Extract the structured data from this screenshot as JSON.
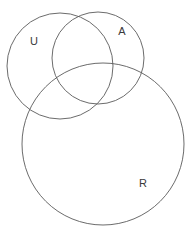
{
  "diagram": {
    "type": "venn",
    "title": "",
    "background_color": "#ffffff",
    "stroke_color": "#5a5a5a",
    "label_color": "#3a3a3a",
    "sets": [
      {
        "id": "U",
        "label": "U",
        "label_x": 34,
        "label_y": 42,
        "cx": 60,
        "cy": 66,
        "r": 53
      },
      {
        "id": "A",
        "label": "A",
        "label_x": 122,
        "label_y": 32,
        "cx": 98,
        "cy": 58,
        "r": 46
      },
      {
        "id": "R",
        "label": "R",
        "label_x": 143,
        "label_y": 184,
        "cx": 103,
        "cy": 144,
        "r": 81
      }
    ]
  }
}
